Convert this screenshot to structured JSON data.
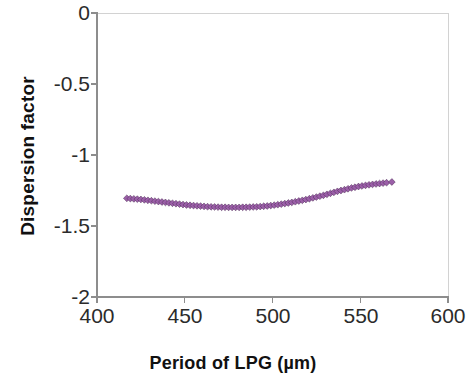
{
  "chart_data": {
    "type": "scatter",
    "title": "",
    "xlabel": "Period of LPG (µm)",
    "ylabel": "Dispersion factor",
    "xlim": [
      400,
      600
    ],
    "ylim": [
      -2,
      0
    ],
    "xticks": [
      "400",
      "450",
      "500",
      "550",
      "600"
    ],
    "xtick_values": [
      400,
      450,
      500,
      550,
      600
    ],
    "yticks": [
      "0",
      "-0.5",
      "-1",
      "-1.5",
      "-2"
    ],
    "ytick_values": [
      0,
      -0.5,
      -1,
      -1.5,
      -2
    ],
    "grid": false,
    "legend": false,
    "marker": "diamond",
    "marker_color": "#9B5FA8",
    "line_color": "#4B2B52",
    "series": [
      {
        "name": "Dispersion factor",
        "x": [
          417,
          419,
          421,
          423,
          425,
          427,
          429,
          431,
          433,
          435,
          437,
          439,
          441,
          443,
          445,
          447,
          449,
          451,
          453,
          455,
          457,
          459,
          461,
          463,
          465,
          467,
          469,
          471,
          473,
          475,
          477,
          479,
          481,
          483,
          485,
          487,
          489,
          491,
          493,
          495,
          497,
          499,
          501,
          503,
          505,
          507,
          509,
          511,
          513,
          515,
          517,
          519,
          521,
          523,
          525,
          527,
          529,
          531,
          533,
          535,
          537,
          539,
          541,
          543,
          545,
          547,
          549,
          551,
          553,
          555,
          557,
          559,
          561,
          563,
          565,
          568
        ],
        "y": [
          -1.305,
          -1.307,
          -1.309,
          -1.311,
          -1.313,
          -1.316,
          -1.319,
          -1.322,
          -1.325,
          -1.328,
          -1.331,
          -1.334,
          -1.337,
          -1.34,
          -1.343,
          -1.346,
          -1.349,
          -1.352,
          -1.354,
          -1.356,
          -1.358,
          -1.36,
          -1.362,
          -1.364,
          -1.365,
          -1.366,
          -1.367,
          -1.368,
          -1.368,
          -1.369,
          -1.369,
          -1.369,
          -1.369,
          -1.368,
          -1.368,
          -1.367,
          -1.366,
          -1.365,
          -1.363,
          -1.361,
          -1.359,
          -1.356,
          -1.353,
          -1.35,
          -1.346,
          -1.342,
          -1.338,
          -1.334,
          -1.329,
          -1.324,
          -1.319,
          -1.314,
          -1.308,
          -1.302,
          -1.296,
          -1.29,
          -1.284,
          -1.277,
          -1.27,
          -1.263,
          -1.256,
          -1.25,
          -1.244,
          -1.238,
          -1.232,
          -1.227,
          -1.222,
          -1.218,
          -1.214,
          -1.21,
          -1.207,
          -1.204,
          -1.201,
          -1.198,
          -1.195,
          -1.19
        ]
      }
    ]
  },
  "axes": {
    "axis_color": "#8d8d8d",
    "tick_color": "#8d8d8d"
  }
}
